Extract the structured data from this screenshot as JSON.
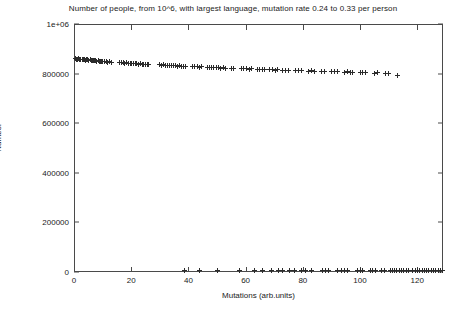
{
  "chart_data": {
    "type": "scatter",
    "title": "Number of people, from 10^6, with largest language, mutation rate 0.24 to 0.33 per person",
    "xlabel": "Mutations (arb.units)",
    "ylabel": "Number",
    "xlim": [
      0,
      129
    ],
    "ylim": [
      0,
      1000000
    ],
    "grid": false,
    "legend": null,
    "marker": "plus",
    "marker_color": "#2b2b2b",
    "xticks": [
      0,
      20,
      40,
      60,
      80,
      100,
      120
    ],
    "xtick_labels": [
      "0",
      "20",
      "40",
      "60",
      "80",
      "100",
      "120"
    ],
    "yticks": [
      0,
      200000,
      400000,
      600000,
      800000,
      1000000
    ],
    "ytick_labels": [
      "0",
      "200000",
      "400000",
      "600000",
      "800000",
      "1e+06"
    ],
    "series": [
      {
        "name": "largest-language-population",
        "points": [
          [
            0.4,
            860000
          ],
          [
            0.8,
            858000
          ],
          [
            1.2,
            857000
          ],
          [
            1.6,
            859000
          ],
          [
            2.0,
            856000
          ],
          [
            2.4,
            858000
          ],
          [
            2.8,
            855000
          ],
          [
            3.2,
            857000
          ],
          [
            3.6,
            856000
          ],
          [
            4.0,
            854000
          ],
          [
            4.4,
            856000
          ],
          [
            4.8,
            855000
          ],
          [
            5.2,
            853000
          ],
          [
            5.6,
            855000
          ],
          [
            6.0,
            854000
          ],
          [
            6.4,
            852000
          ],
          [
            6.8,
            853000
          ],
          [
            7.2,
            851000
          ],
          [
            7.6,
            852000
          ],
          [
            8.0,
            850000
          ],
          [
            8.4,
            851000
          ],
          [
            8.8,
            849000
          ],
          [
            9.2,
            850000
          ],
          [
            9.6,
            848000
          ],
          [
            10.0,
            849000
          ],
          [
            10.6,
            847000
          ],
          [
            11.2,
            848000
          ],
          [
            11.8,
            846000
          ],
          [
            12.4,
            847000
          ],
          [
            13.0,
            845000
          ],
          [
            16.0,
            845000
          ],
          [
            16.6,
            843000
          ],
          [
            17.2,
            844000
          ],
          [
            17.8,
            842000
          ],
          [
            18.4,
            843000
          ],
          [
            19.0,
            841000
          ],
          [
            19.6,
            842000
          ],
          [
            20.2,
            840000
          ],
          [
            20.8,
            841000
          ],
          [
            21.4,
            839000
          ],
          [
            22.0,
            840000
          ],
          [
            22.6,
            838000
          ],
          [
            23.2,
            839000
          ],
          [
            23.8,
            837000
          ],
          [
            24.4,
            838000
          ],
          [
            25.0,
            836000
          ],
          [
            25.6,
            837000
          ],
          [
            26.2,
            835000
          ],
          [
            30.0,
            836000
          ],
          [
            30.7,
            834000
          ],
          [
            31.4,
            835000
          ],
          [
            32.1,
            833000
          ],
          [
            32.8,
            834000
          ],
          [
            33.5,
            832000
          ],
          [
            34.2,
            833000
          ],
          [
            34.9,
            831000
          ],
          [
            35.6,
            832000
          ],
          [
            36.3,
            830000
          ],
          [
            37.0,
            831000
          ],
          [
            37.7,
            829000
          ],
          [
            38.4,
            830000
          ],
          [
            39.1,
            828000
          ],
          [
            41.5,
            829000
          ],
          [
            42.3,
            827000
          ],
          [
            43.1,
            828000
          ],
          [
            43.9,
            826000
          ],
          [
            44.7,
            827000
          ],
          [
            46.5,
            825000
          ],
          [
            47.3,
            826000
          ],
          [
            48.1,
            824000
          ],
          [
            48.9,
            825000
          ],
          [
            49.7,
            823000
          ],
          [
            50.5,
            824000
          ],
          [
            51.3,
            822000
          ],
          [
            52.1,
            823000
          ],
          [
            52.9,
            821000
          ],
          [
            55.0,
            822000
          ],
          [
            55.8,
            820000
          ],
          [
            58.5,
            821000
          ],
          [
            59.4,
            819000
          ],
          [
            60.3,
            820000
          ],
          [
            61.2,
            818000
          ],
          [
            62.1,
            819000
          ],
          [
            64.0,
            817000
          ],
          [
            64.9,
            818000
          ],
          [
            65.8,
            816000
          ],
          [
            66.7,
            817000
          ],
          [
            68.5,
            815000
          ],
          [
            69.4,
            816000
          ],
          [
            70.3,
            814000
          ],
          [
            71.2,
            815000
          ],
          [
            73.0,
            813000
          ],
          [
            74.0,
            814000
          ],
          [
            75.0,
            812000
          ],
          [
            77.5,
            813000
          ],
          [
            78.5,
            811000
          ],
          [
            79.5,
            812000
          ],
          [
            82.0,
            810000
          ],
          [
            83.0,
            811000
          ],
          [
            84.0,
            809000
          ],
          [
            86.5,
            810000
          ],
          [
            87.5,
            808000
          ],
          [
            90.0,
            809000
          ],
          [
            91.0,
            807000
          ],
          [
            92.0,
            808000
          ],
          [
            94.5,
            806000
          ],
          [
            95.5,
            807000
          ],
          [
            96.5,
            805000
          ],
          [
            97.5,
            806000
          ],
          [
            100.0,
            804000
          ],
          [
            101.0,
            805000
          ],
          [
            102.0,
            803000
          ],
          [
            105.0,
            802000
          ],
          [
            106.0,
            803000
          ],
          [
            109.0,
            800000
          ],
          [
            110.0,
            801000
          ],
          [
            113.0,
            792000
          ],
          [
            50.0,
            7000
          ],
          [
            58.0,
            5000
          ],
          [
            63.0,
            6000
          ],
          [
            66.0,
            5000
          ],
          [
            69.0,
            6000
          ],
          [
            71.5,
            5000
          ],
          [
            73.0,
            6000
          ],
          [
            75.5,
            5000
          ],
          [
            77.0,
            6000
          ],
          [
            79.5,
            5000
          ],
          [
            81.0,
            6000
          ],
          [
            83.0,
            5000
          ],
          [
            87.0,
            6000
          ],
          [
            88.0,
            5000
          ],
          [
            89.0,
            6000
          ],
          [
            92.0,
            5000
          ],
          [
            93.5,
            6000
          ],
          [
            94.5,
            5000
          ],
          [
            95.5,
            6000
          ],
          [
            99.0,
            5000
          ],
          [
            100.0,
            6000
          ],
          [
            101.0,
            5000
          ],
          [
            103.5,
            6000
          ],
          [
            104.5,
            5000
          ],
          [
            105.5,
            6000
          ],
          [
            107.5,
            5000
          ],
          [
            108.5,
            6000
          ],
          [
            110.5,
            5000
          ],
          [
            111.3,
            6000
          ],
          [
            112.1,
            5000
          ],
          [
            112.9,
            6000
          ],
          [
            113.7,
            5000
          ],
          [
            114.5,
            6000
          ],
          [
            115.3,
            5000
          ],
          [
            116.1,
            6000
          ],
          [
            116.9,
            5000
          ],
          [
            118.5,
            6000
          ],
          [
            119.3,
            5000
          ],
          [
            120.1,
            6000
          ],
          [
            120.9,
            5000
          ],
          [
            121.7,
            6000
          ],
          [
            122.5,
            5000
          ],
          [
            123.3,
            6000
          ],
          [
            124.1,
            5000
          ],
          [
            124.9,
            6000
          ],
          [
            125.7,
            5000
          ],
          [
            126.5,
            6000
          ],
          [
            127.3,
            5000
          ],
          [
            128.1,
            6000
          ],
          [
            128.8,
            5000
          ],
          [
            38.5,
            6000
          ],
          [
            44.0,
            5000
          ]
        ]
      }
    ]
  }
}
